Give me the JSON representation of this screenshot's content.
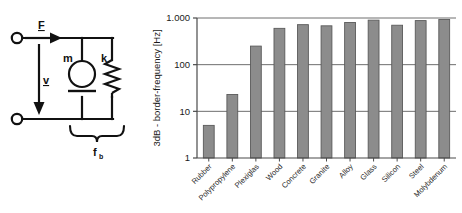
{
  "figure": {
    "panels": [
      "mechanical-circuit-diagram",
      "border-frequency-bar-chart"
    ]
  },
  "diagram": {
    "name": "mechanical-impedance-equivalent-circuit",
    "labels": {
      "force": "F",
      "velocity": "v",
      "mass": "m",
      "stiffness": "k",
      "border_frequency": "f",
      "border_frequency_sub": "b"
    },
    "elements": [
      {
        "name": "input-terminal-top",
        "type": "terminal"
      },
      {
        "name": "input-terminal-bottom",
        "type": "terminal"
      },
      {
        "name": "force-arrow",
        "type": "arrow",
        "direction": "right"
      },
      {
        "name": "velocity-arrow",
        "type": "arrow",
        "direction": "down"
      },
      {
        "name": "mass-element",
        "type": "mass-symbol"
      },
      {
        "name": "spring-element",
        "type": "spring-symbol"
      },
      {
        "name": "brace",
        "type": "curly-brace"
      }
    ],
    "colors": {
      "line": "#111111",
      "background": "#ffffff"
    }
  },
  "chart_data": {
    "type": "bar",
    "title": "",
    "xlabel": "",
    "ylabel": "3dB - border-frequency [Hz]",
    "yscale": "log",
    "ylim": [
      1,
      1000
    ],
    "ytick_labels": [
      "1.000",
      "100",
      "10",
      "1"
    ],
    "ytick_values": [
      1000,
      100,
      10,
      1
    ],
    "grid": true,
    "legend": null,
    "categories": [
      "Rubber",
      "Polypropylene",
      "Plexiglas",
      "Wood",
      "Concrete",
      "Granite",
      "Alloy",
      "Glass",
      "Silicon",
      "Steel",
      "Molybdenum"
    ],
    "values": [
      5,
      23,
      250,
      600,
      720,
      680,
      800,
      900,
      700,
      880,
      930
    ],
    "units": "Hz",
    "bar_color": "#8c8c8c",
    "bar_edge_color": "#5a5a5a"
  }
}
